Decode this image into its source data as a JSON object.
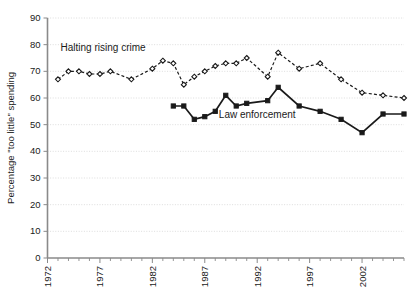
{
  "chart_data": {
    "type": "line",
    "title": "",
    "subtitle": "",
    "xlabel": "",
    "ylabel": "Percentage \"too little\" spending",
    "xlim": [
      1972,
      2006
    ],
    "ylim": [
      0,
      90
    ],
    "grid": true,
    "legend_position": "inline-annotation",
    "ytick_labels": [
      "0",
      "10",
      "20",
      "30",
      "40",
      "50",
      "60",
      "70",
      "80",
      "90"
    ],
    "ytick_values": [
      0,
      10,
      20,
      30,
      40,
      50,
      60,
      70,
      80,
      90
    ],
    "xtick_labels": [
      "1972",
      "1977",
      "1982",
      "1987",
      "1992",
      "1997",
      "2002"
    ],
    "xtick_values": [
      1972,
      1977,
      1982,
      1987,
      1992,
      1997,
      2002
    ],
    "x_minor_tick_interval": 1,
    "annotations": [
      {
        "text": "Halting rising crime",
        "x": 1977.3,
        "y": 77.5
      },
      {
        "text": "Law enforcement",
        "x": 1992.0,
        "y": 52.5
      }
    ],
    "series": [
      {
        "name": "Halting rising crime",
        "style": "dashed",
        "marker": "open-diamond",
        "color": "#1a1a1a",
        "x": [
          1973,
          1974,
          1975,
          1976,
          1977,
          1978,
          1980,
          1982,
          1983,
          1984,
          1985,
          1986,
          1987,
          1988,
          1989,
          1990,
          1991,
          1993,
          1994,
          1996,
          1998,
          2000,
          2002,
          2004,
          2006
        ],
        "values": [
          67,
          70,
          70,
          69,
          69,
          70,
          67,
          71,
          74,
          73,
          65,
          68,
          70,
          72,
          73,
          73,
          75,
          68,
          77,
          71,
          73,
          67,
          62,
          61,
          60
        ]
      },
      {
        "name": "Law enforcement",
        "style": "solid",
        "marker": "filled-square",
        "color": "#1a1a1a",
        "x": [
          1984,
          1985,
          1986,
          1987,
          1988,
          1989,
          1990,
          1991,
          1993,
          1994,
          1996,
          1998,
          2000,
          2002,
          2004,
          2006
        ],
        "values": [
          57,
          57,
          52,
          53,
          55,
          61,
          57,
          58,
          59,
          64,
          57,
          55,
          52,
          47,
          54,
          54
        ]
      }
    ]
  },
  "axis": {
    "y_title": "Percentage \"too little\" spending"
  },
  "labels": {
    "series_dashed": "Halting rising crime",
    "series_solid": "Law enforcement"
  }
}
